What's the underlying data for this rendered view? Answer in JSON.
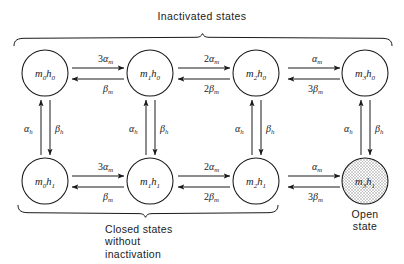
{
  "figure": {
    "type": "state-transition-diagram",
    "title_top": "Inactivated  states",
    "caption_bottom": [
      "Closed  states",
      "without",
      "inactivation"
    ],
    "caption_open": [
      "Open",
      "state"
    ],
    "ink_color": "#1a1a1a",
    "background": "#ffffff",
    "open_state_fill": "#d9d9d9"
  },
  "states": {
    "top_row": [
      {
        "id": "m0h0",
        "m": "m",
        "m_sub": "0",
        "h": "h",
        "h_sub": "0",
        "cx": 45,
        "cy": 73,
        "r": 23,
        "shaded": false
      },
      {
        "id": "m1h0",
        "m": "m",
        "m_sub": "1",
        "h": "h",
        "h_sub": "0",
        "cx": 150,
        "cy": 73,
        "r": 23,
        "shaded": false
      },
      {
        "id": "m2h0",
        "m": "m",
        "m_sub": "2",
        "h": "h",
        "h_sub": "0",
        "cx": 256,
        "cy": 73,
        "r": 23,
        "shaded": false
      },
      {
        "id": "m3h0",
        "m": "m",
        "m_sub": "3",
        "h": "h",
        "h_sub": "0",
        "cx": 365,
        "cy": 73,
        "r": 23,
        "shaded": false
      }
    ],
    "bottom_row": [
      {
        "id": "m0h1",
        "m": "m",
        "m_sub": "0",
        "h": "h",
        "h_sub": "1",
        "cx": 45,
        "cy": 181,
        "r": 23,
        "shaded": false
      },
      {
        "id": "m1h1",
        "m": "m",
        "m_sub": "1",
        "h": "h",
        "h_sub": "1",
        "cx": 150,
        "cy": 181,
        "r": 23,
        "shaded": false
      },
      {
        "id": "m2h1",
        "m": "m",
        "m_sub": "2",
        "h": "h",
        "h_sub": "1",
        "cx": 256,
        "cy": 181,
        "r": 23,
        "shaded": false
      },
      {
        "id": "m3h1",
        "m": "m",
        "m_sub": "3",
        "h": "h",
        "h_sub": "1",
        "cx": 365,
        "cy": 181,
        "r": 23,
        "shaded": true
      }
    ]
  },
  "horizontal_transitions": [
    {
      "row": "top",
      "from": "m0h0",
      "to": "m1h0",
      "forward": {
        "coef": "3",
        "greek": "α",
        "sub": "m"
      },
      "backward": {
        "coef": "",
        "greek": "β",
        "sub": "m"
      },
      "x1": 72,
      "x2": 124,
      "y": 73
    },
    {
      "row": "top",
      "from": "m1h0",
      "to": "m2h0",
      "forward": {
        "coef": "2",
        "greek": "α",
        "sub": "m"
      },
      "backward": {
        "coef": "2",
        "greek": "β",
        "sub": "m"
      },
      "x1": 178,
      "x2": 230,
      "y": 73
    },
    {
      "row": "top",
      "from": "m2h0",
      "to": "m3h0",
      "forward": {
        "coef": "",
        "greek": "α",
        "sub": "m"
      },
      "backward": {
        "coef": "3",
        "greek": "β",
        "sub": "m"
      },
      "x1": 284,
      "x2": 340,
      "y": 73
    },
    {
      "row": "bottom",
      "from": "m0h1",
      "to": "m1h1",
      "forward": {
        "coef": "3",
        "greek": "α",
        "sub": "m"
      },
      "backward": {
        "coef": "",
        "greek": "β",
        "sub": "m"
      },
      "x1": 72,
      "x2": 124,
      "y": 181
    },
    {
      "row": "bottom",
      "from": "m1h1",
      "to": "m2h1",
      "forward": {
        "coef": "2",
        "greek": "α",
        "sub": "m"
      },
      "backward": {
        "coef": "2",
        "greek": "β",
        "sub": "m"
      },
      "x1": 178,
      "x2": 230,
      "y": 181
    },
    {
      "row": "bottom",
      "from": "m2h1",
      "to": "m3h1",
      "forward": {
        "coef": "",
        "greek": "α",
        "sub": "m"
      },
      "backward": {
        "coef": "3",
        "greek": "β",
        "sub": "m"
      },
      "x1": 284,
      "x2": 340,
      "y": 181
    }
  ],
  "vertical_transitions": [
    {
      "column": 0,
      "up": {
        "greek": "α",
        "sub": "h"
      },
      "down": {
        "greek": "β",
        "sub": "h"
      },
      "x": 45,
      "y1": 100,
      "y2": 155
    },
    {
      "column": 1,
      "up": {
        "greek": "α",
        "sub": "h"
      },
      "down": {
        "greek": "β",
        "sub": "h"
      },
      "x": 150,
      "y1": 100,
      "y2": 155
    },
    {
      "column": 2,
      "up": {
        "greek": "α",
        "sub": "h"
      },
      "down": {
        "greek": "β",
        "sub": "h"
      },
      "x": 256,
      "y1": 100,
      "y2": 155
    },
    {
      "column": 3,
      "up": {
        "greek": "α",
        "sub": "h"
      },
      "down": {
        "greek": "β",
        "sub": "h"
      },
      "x": 365,
      "y1": 100,
      "y2": 155
    }
  ],
  "braces": {
    "top": {
      "x_left": 14,
      "x_right": 392,
      "y": 38,
      "direction": "down",
      "label": "Inactivated  states",
      "label_x": 202,
      "label_y": 14
    },
    "bottom": {
      "x_left": 18,
      "x_right": 278,
      "y": 213,
      "direction": "up",
      "label_lines": [
        "Closed  states",
        "without",
        "inactivation"
      ],
      "label_x": 105,
      "label_y": 222
    }
  },
  "open_state_label": {
    "x": 365,
    "y": 218,
    "lines": [
      "Open",
      "state"
    ]
  }
}
